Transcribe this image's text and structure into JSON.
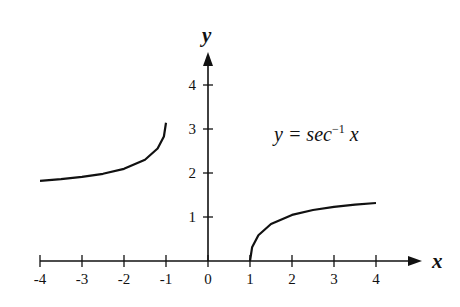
{
  "chart_data": {
    "type": "line",
    "title": "",
    "annotation": "y = sec⁻¹ x",
    "xlabel": "x",
    "ylabel": "y",
    "xlim": [
      -4,
      4
    ],
    "ylim": [
      0,
      4.5
    ],
    "x_ticks": [
      "-4",
      "-3",
      "-2",
      "-1",
      "0",
      "1",
      "2",
      "3",
      "4"
    ],
    "y_ticks": [
      "1",
      "2",
      "3",
      "4"
    ],
    "grid": false,
    "series": [
      {
        "name": "sec^-1 x (x <= -1)",
        "x": [
          -4,
          -3.5,
          -3,
          -2.5,
          -2,
          -1.5,
          -1.2,
          -1.05,
          -1
        ],
        "y": [
          1.823,
          1.861,
          1.911,
          1.982,
          2.094,
          2.301,
          2.556,
          2.83,
          3.142
        ]
      },
      {
        "name": "sec^-1 x (x >= 1)",
        "x": [
          1,
          1.05,
          1.2,
          1.5,
          2,
          2.5,
          3,
          3.5,
          4
        ],
        "y": [
          0,
          0.311,
          0.586,
          0.841,
          1.047,
          1.159,
          1.231,
          1.281,
          1.318
        ]
      }
    ]
  },
  "labels": {
    "x_axis": "x",
    "y_axis": "y",
    "eq_prefix": "y = sec",
    "eq_sup": "−1",
    "eq_var": "x"
  }
}
